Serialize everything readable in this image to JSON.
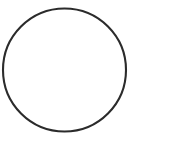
{
  "canvas": {
    "width": 176,
    "height": 141,
    "background_color": "#ffffff",
    "title": "Circle Outline"
  },
  "shapes": [
    {
      "name": "circle-outline",
      "kind": "circle",
      "center_x": 64.5,
      "center_y": 70,
      "radius": 61.5,
      "stroke_color": "#2b2b2b",
      "stroke_width": 2.1,
      "fill": "none"
    }
  ],
  "labels": [],
  "text": []
}
